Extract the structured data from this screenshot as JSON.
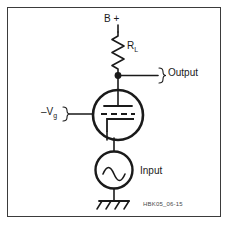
{
  "figure": {
    "background": "#ffffff",
    "border_color": "#3b3b3b",
    "ink_color": "#1a1a1a",
    "width": 230,
    "height": 226
  },
  "labels": {
    "supply": "B +",
    "load_resistor": "R",
    "load_resistor_sub": "L",
    "output": "Output",
    "grid_bias_sign": "–V",
    "grid_bias_sub": "g",
    "input": "Input",
    "code": "HBK05_06-15"
  },
  "components": {
    "resistor": {
      "name": "load-resistor",
      "designator": "R_L"
    },
    "tube": {
      "name": "triode-vacuum-tube",
      "electrodes": [
        "plate",
        "grid",
        "cathode"
      ]
    },
    "source": {
      "name": "ac-input-source",
      "waveform": "sine"
    },
    "ground": {
      "name": "earth-ground"
    },
    "output_node": {
      "name": "output-junction"
    }
  }
}
